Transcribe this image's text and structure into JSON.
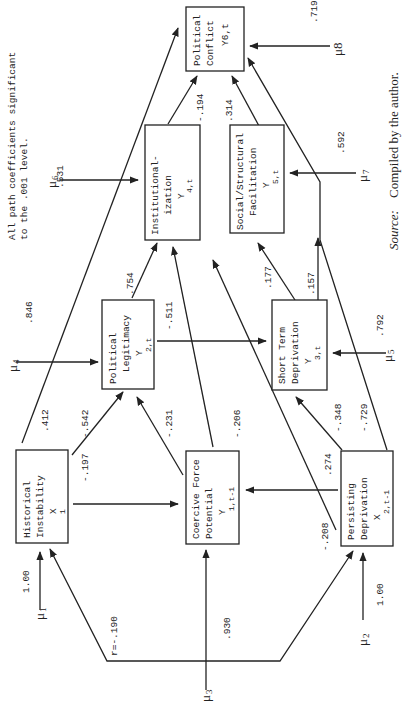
{
  "note": {
    "line1": "All path coefficients significant",
    "line2": "to the .001 level."
  },
  "source": {
    "prefix": "Source:",
    "text": "Compiled by the author."
  },
  "nodes": {
    "political_conflict": {
      "l1": "Political",
      "l2": "Conflict",
      "var": "Y6,t"
    },
    "institutionalization": {
      "l1": "Institutional-",
      "l2": "ization",
      "var": "Y",
      "sub": "4,t"
    },
    "social_structural": {
      "l1": "Social/Structural",
      "l2": "Facilitation",
      "var": "Y",
      "sub": "5,t"
    },
    "political_legitimacy": {
      "l1": "Political",
      "l2": "Legitimacy",
      "var": "Y",
      "sub": "2,t"
    },
    "short_term_deprivation": {
      "l1": "Short Term",
      "l2": "Deprivation",
      "var": "Y",
      "sub": "3,t"
    },
    "historical_instability": {
      "l1": "Historical",
      "l2": "Instability",
      "var": "X",
      "sub": "1"
    },
    "coercive_force": {
      "l1": "Coercive Force",
      "l2": "Potential",
      "var": "Y",
      "sub": "1,t-1"
    },
    "persisting_deprivation": {
      "l1": "Persisting",
      "l2": "Deprivation",
      "var": "X",
      "sub": "2,t-1"
    }
  },
  "disturbances": {
    "u1": {
      "label": "μ",
      "sub": "1",
      "coef": "1.00"
    },
    "u2": {
      "label": "μ",
      "sub": "2",
      "coef": "1.00"
    },
    "u3": {
      "label": "μ",
      "sub": "3",
      "coef": ".930"
    },
    "u4": {
      "label": "μ",
      "sub": "4",
      "coef": ".846"
    },
    "u5": {
      "label": "μ",
      "sub": "5",
      "coef": ".792"
    },
    "u6": {
      "label": "μ",
      "sub": "6",
      "coef": ".531"
    },
    "u7": {
      "label": "μ",
      "sub": "7",
      "coef": ".592"
    },
    "u8": {
      "label": "μ8",
      "coef": ".719"
    }
  },
  "paths": {
    "hist_to_conflict": ".412",
    "hist_to_legitimacy": "-.542",
    "hist_to_coercive": "-.197",
    "coercive_to_legitimacy": "-.231",
    "coercive_to_institutionalization": "-.206",
    "legitimacy_to_institutionalization": ".754",
    "legitimacy_to_shortterm": "-.511",
    "institutionalization_to_conflict": "-.194",
    "social_to_conflict": ".314",
    "shortterm_to_institutionalization": ".177",
    "shortterm_to_social": ".157",
    "persisting_to_coercive": ".274",
    "persisting_to_institutionalization": "-.208",
    "persisting_to_shortterm": "-.348",
    "persisting_to_conflict": "-.729",
    "correlation_x1_x2": "r=-.190"
  }
}
